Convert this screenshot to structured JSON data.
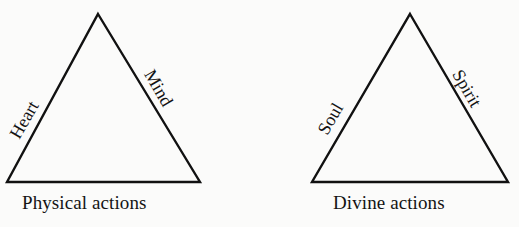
{
  "page": {
    "background_color": "#fbfbfa",
    "ink_color": "#111111",
    "width": 519,
    "height": 227
  },
  "diagram": {
    "type": "paired-triangles",
    "triangles": [
      {
        "id": "physical",
        "caption": "Physical actions",
        "left_label": "Heart",
        "right_label": "Mind",
        "apex": {
          "x": 98,
          "y": 14
        },
        "base_left": {
          "x": 7,
          "y": 182
        },
        "base_right": {
          "x": 200,
          "y": 182
        }
      },
      {
        "id": "divine",
        "caption": "Divine actions",
        "left_label": "Soul",
        "right_label": "Spirit",
        "apex": {
          "x": 410,
          "y": 14
        },
        "base_left": {
          "x": 312,
          "y": 182
        },
        "base_right": {
          "x": 508,
          "y": 182
        }
      }
    ]
  }
}
